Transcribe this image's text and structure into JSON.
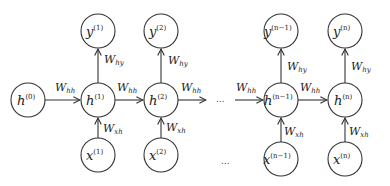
{
  "diagram": {
    "type": "unrolled-rnn",
    "nodes": {
      "h0": {
        "base": "h",
        "sup": "(0)"
      },
      "h1": {
        "base": "h",
        "sup": "(1)"
      },
      "h2": {
        "base": "h",
        "sup": "(2)"
      },
      "hn1": {
        "base": "h",
        "sup": "(n−1)"
      },
      "hn": {
        "base": "h",
        "sup": "(n)"
      },
      "y1": {
        "base": "y",
        "sup": "(1)"
      },
      "y2": {
        "base": "y",
        "sup": "(2)"
      },
      "yn1": {
        "base": "y",
        "sup": "(n−1)"
      },
      "yn": {
        "base": "y",
        "sup": "(n)"
      },
      "x1": {
        "base": "x",
        "sup": "(1)"
      },
      "x2": {
        "base": "x",
        "sup": "(2)"
      },
      "xn1": {
        "base": "x",
        "sup": "(n−1)"
      },
      "xn": {
        "base": "x",
        "sup": "(n)"
      }
    },
    "weights": {
      "hh": {
        "base": "W",
        "sub": "hh"
      },
      "hy": {
        "base": "W",
        "sub": "hy"
      },
      "xh": {
        "base": "W",
        "sub": "xh"
      }
    },
    "ellipsis": "..."
  }
}
